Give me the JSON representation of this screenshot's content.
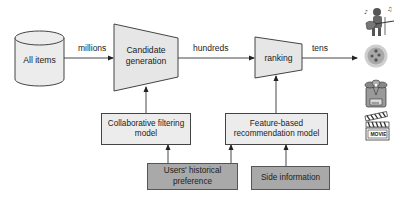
{
  "diagram": {
    "nodes": {
      "all_items": {
        "label": "All items",
        "shape": "cylinder"
      },
      "candidate_generation": {
        "label": "Candidate generation",
        "line1": "Candidate",
        "line2": "generation",
        "shape": "trapezoid"
      },
      "ranking": {
        "label": "ranking",
        "shape": "trapezoid"
      },
      "collaborative_filtering": {
        "label": "Collaborative filtering model",
        "line1": "Collaborative filtering",
        "line2": "model",
        "shape": "box"
      },
      "feature_based": {
        "label": "Feature-based recommendation model",
        "line1": "Feature-based",
        "line2": "recommendation model",
        "shape": "box"
      },
      "users_history": {
        "label": "Users' historical preference",
        "line1": "Users' historical",
        "line2": "preference",
        "shape": "box-dark"
      },
      "side_info": {
        "label": "Side information",
        "shape": "box-dark"
      }
    },
    "edges": [
      {
        "from": "all_items",
        "to": "candidate_generation",
        "label": "millions"
      },
      {
        "from": "candidate_generation",
        "to": "ranking",
        "label": "hundreds"
      },
      {
        "from": "ranking",
        "to": "output_items",
        "label": "tens"
      },
      {
        "from": "collaborative_filtering",
        "to": "candidate_generation",
        "label": ""
      },
      {
        "from": "feature_based",
        "to": "ranking",
        "label": ""
      },
      {
        "from": "users_history",
        "to": "collaborative_filtering",
        "label": ""
      },
      {
        "from": "users_history",
        "to": "feature_based",
        "label": ""
      },
      {
        "from": "side_info",
        "to": "feature_based",
        "label": ""
      }
    ],
    "edge_labels": {
      "millions": "millions",
      "hundreds": "hundreds",
      "tens": "tens"
    },
    "output_items": [
      {
        "icon": "musician-icon"
      },
      {
        "icon": "food-dish-icon"
      },
      {
        "icon": "shopping-bag-icon"
      },
      {
        "icon": "movie-clapboard-icon",
        "text": "MOVIE"
      }
    ],
    "colors": {
      "light_fill": "#ececec",
      "dark_fill": "#a9a9a9",
      "stroke": "#444444"
    }
  }
}
